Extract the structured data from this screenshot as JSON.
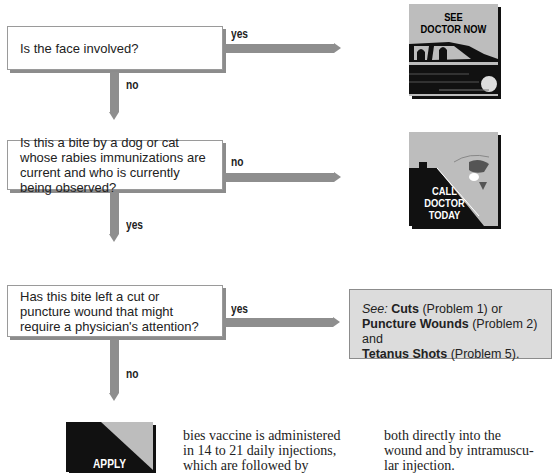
{
  "flowchart": {
    "q1": {
      "text": "Is the face involved?",
      "yes_label": "yes",
      "no_label": "no"
    },
    "q2": {
      "text": "Is this a bite by a dog or cat whose rabies immunizations are current and who is currently being observed?",
      "no_label": "no",
      "yes_label": "yes"
    },
    "q3": {
      "text": "Has this bite left a cut or puncture wound that might require a physician's attention?",
      "yes_label": "yes",
      "no_label": "no"
    },
    "outcome1": {
      "line1": "SEE",
      "line2": "DOCTOR NOW"
    },
    "outcome2": {
      "line1": "CALL",
      "line2": "DOCTOR",
      "line3": "TODAY"
    },
    "outcome3": {
      "see": "See:",
      "cuts": "Cuts",
      "cuts_ref": " (Problem 1) or",
      "puncture": "Puncture Wounds",
      "puncture_ref": " (Problem 2) and",
      "tetanus": "Tetanus Shots",
      "tetanus_ref": " (Problem 5)."
    },
    "outcome4": {
      "line1": "APPLY"
    }
  },
  "body_text": {
    "col1": [
      "bies vaccine is administered",
      "in 14 to 21 daily injections,",
      "which are followed by"
    ],
    "col2": [
      "both directly into the",
      "wound and by intramuscu-",
      "lar injection."
    ]
  },
  "colors": {
    "arrow": "#8e8e8e",
    "picture_bg": "#bdbdbd",
    "see_box_bg": "#dcdcdc"
  }
}
